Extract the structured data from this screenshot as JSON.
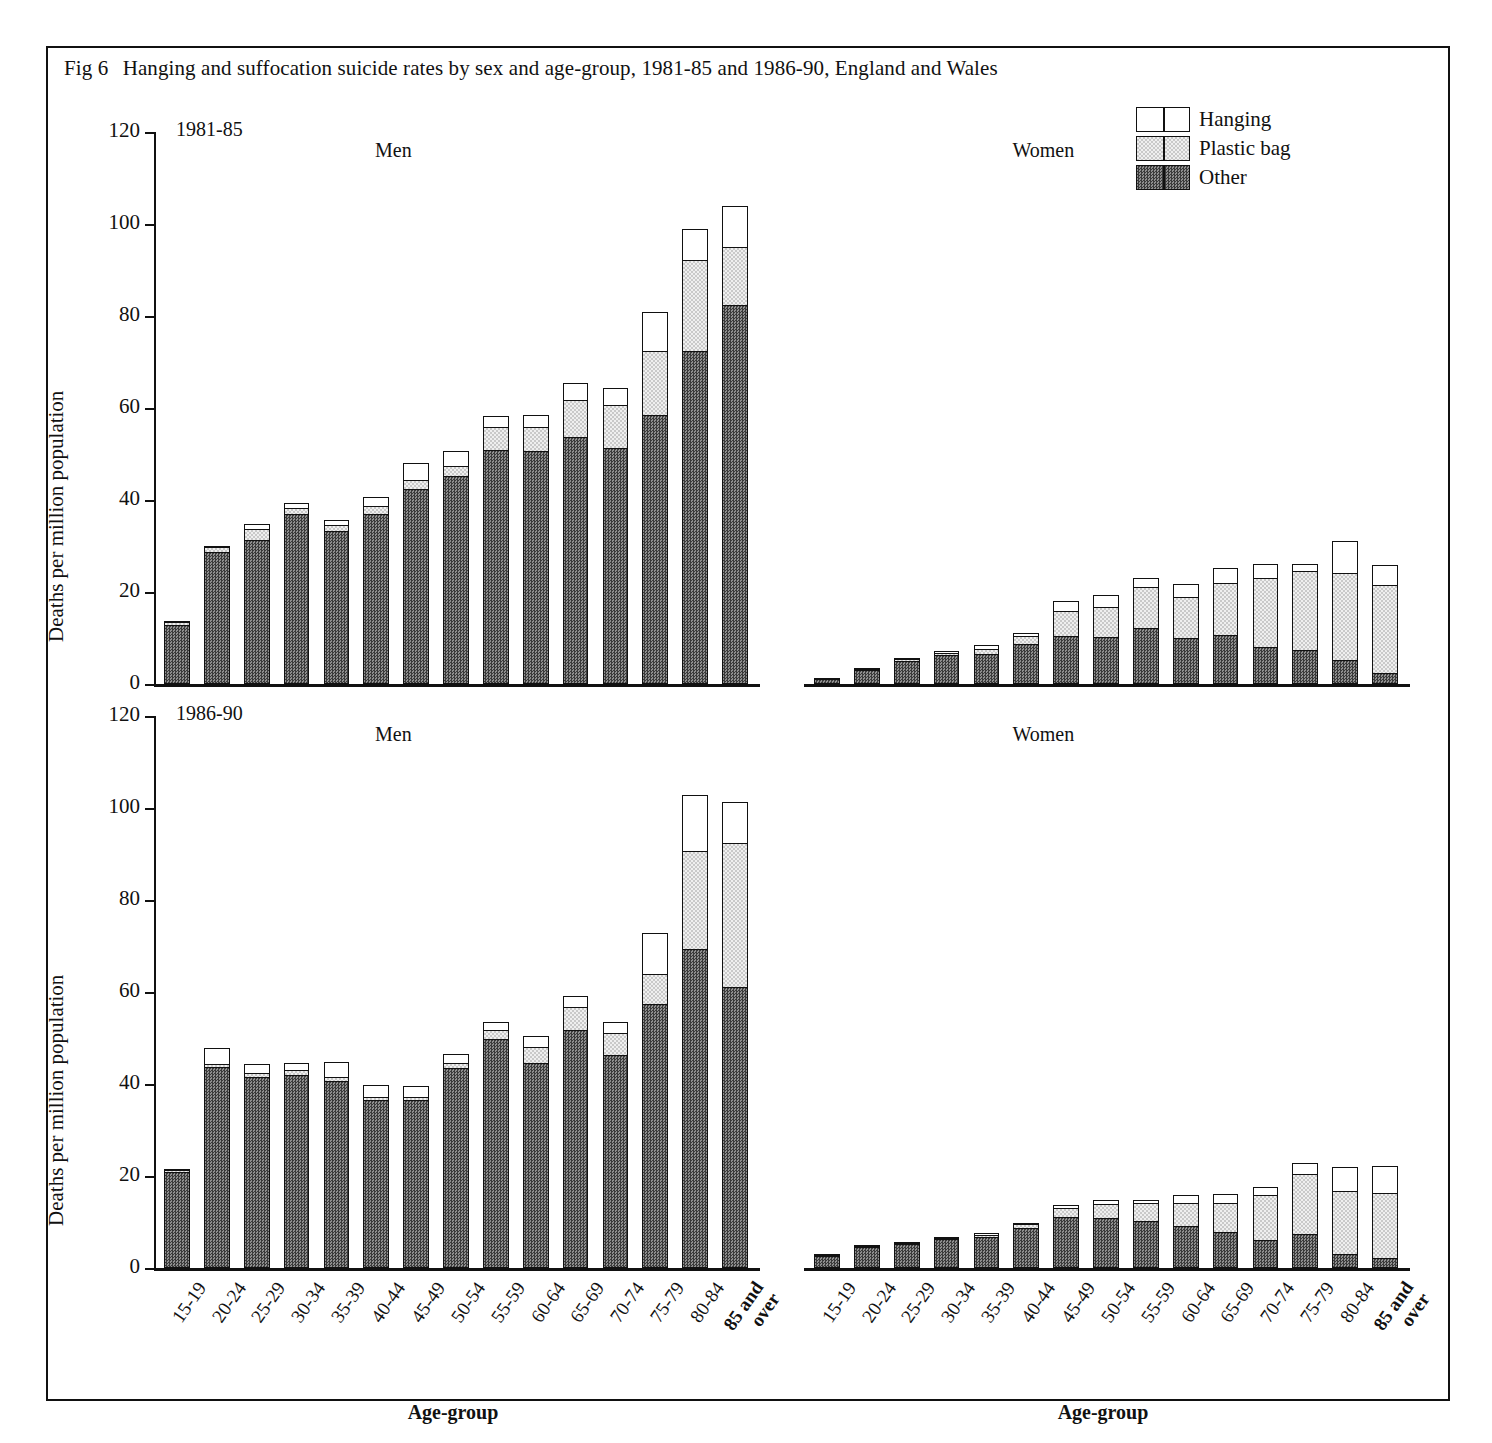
{
  "caption": {
    "fig_number": "Fig 6",
    "text": "Hanging and suffocation suicide rates by sex and age-group, 1981-85 and 1986-90,  England and Wales"
  },
  "legend": {
    "position": "top-right",
    "items": [
      {
        "label": "Hanging",
        "fill": "hanging",
        "color": "#ffffff"
      },
      {
        "label": "Plastic bag",
        "fill": "plastic",
        "color": "#e8e8e8"
      },
      {
        "label": "Other",
        "fill": "other",
        "color": "#5a5a5a"
      }
    ]
  },
  "axes": {
    "y_title": "Deaths per million population",
    "x_title": "Age-group",
    "y_ticks": [
      0,
      20,
      40,
      60,
      80,
      100,
      120
    ],
    "y_tick_labels": [
      "0",
      "20",
      "40",
      "60",
      "80",
      "100",
      "120"
    ],
    "ylim": [
      0,
      120
    ]
  },
  "panels": [
    {
      "period": "1981-85",
      "sex": "Men",
      "key": "men_1981_85"
    },
    {
      "period": "1981-85",
      "sex": "Women",
      "key": "women_1981_85"
    },
    {
      "period": "1986-90",
      "sex": "Men",
      "key": "men_1986_90"
    },
    {
      "period": "1986-90",
      "sex": "Women",
      "key": "women_1986_90"
    }
  ],
  "chart_data": {
    "type": "bar",
    "subtype": "stacked",
    "title": "Fig 6  Hanging and suffocation suicide rates by sex and age-group, 1981-85 and 1986-90,  England and Wales",
    "xlabel": "Age-group",
    "ylabel": "Deaths per million population",
    "ylim": [
      0,
      120
    ],
    "ytick_step": 20,
    "grid": false,
    "legend_position": "top-right",
    "categories": [
      "15-19",
      "20-24",
      "25-29",
      "30-34",
      "35-39",
      "40-44",
      "45-49",
      "50-54",
      "55-59",
      "60-64",
      "65-69",
      "70-74",
      "75-79",
      "80-84",
      "85 and over"
    ],
    "stack_order": [
      "Other",
      "Plastic bag",
      "Hanging"
    ],
    "panels": [
      {
        "period": "1981-85",
        "sex": "Men",
        "series": [
          {
            "name": "Other",
            "values": [
              12.8,
              28.8,
              31.3,
              37.0,
              33.3,
              37.0,
              42.4,
              45.2,
              50.9,
              50.6,
              53.6,
              51.3,
              58.5,
              72.5,
              82.3
            ]
          },
          {
            "name": "Plastic bag",
            "values": [
              0.9,
              1.2,
              2.7,
              1.5,
              1.5,
              1.9,
              2.2,
              2.4,
              5.2,
              5.5,
              8.3,
              9.6,
              14.2,
              19.9,
              13.0
            ]
          },
          {
            "name": "Hanging",
            "values": [
              0.4,
              0.6,
              1.2,
              1.4,
              1.4,
              2.2,
              4.0,
              3.6,
              2.6,
              2.8,
              4.1,
              4.0,
              8.8,
              7.0,
              9.2
            ]
          }
        ],
        "totals": [
          14.1,
          30.6,
          35.2,
          39.9,
          36.2,
          41.1,
          48.6,
          51.2,
          58.7,
          58.9,
          66.0,
          64.9,
          81.5,
          99.4,
          104.5
        ]
      },
      {
        "period": "1981-85",
        "sex": "Women",
        "series": [
          {
            "name": "Other",
            "values": [
              1.1,
              3.0,
              4.9,
              6.2,
              6.6,
              8.6,
              10.5,
              10.2,
              12.2,
              10.1,
              10.7,
              8.0,
              7.4,
              5.3,
              2.5
            ]
          },
          {
            "name": "Plastic bag",
            "values": [
              0.2,
              0.5,
              0.7,
              0.9,
              1.2,
              2.2,
              5.6,
              6.9,
              9.1,
              9.1,
              11.6,
              15.2,
              17.4,
              19.1,
              19.3
            ]
          },
          {
            "name": "Hanging",
            "values": [
              0.1,
              0.3,
              0.4,
              0.5,
              1.2,
              0.9,
              2.4,
              2.7,
              2.3,
              3.0,
              3.5,
              3.5,
              1.8,
              7.1,
              4.6
            ]
          }
        ],
        "totals": [
          1.4,
          3.8,
          6.0,
          7.6,
          9.0,
          11.7,
          18.5,
          19.8,
          23.6,
          22.2,
          25.8,
          26.7,
          26.6,
          31.5,
          26.4
        ]
      },
      {
        "period": "1986-90",
        "sex": "Men",
        "series": [
          {
            "name": "Other",
            "values": [
              20.9,
              43.7,
              41.5,
              42.0,
              40.7,
              36.6,
              36.5,
              43.4,
              49.7,
              44.6,
              51.7,
              46.4,
              57.5,
              69.4,
              61.1
            ]
          },
          {
            "name": "Plastic bag",
            "values": [
              0.7,
              1.0,
              1.2,
              1.2,
              1.0,
              0.8,
              0.9,
              1.5,
              2.4,
              3.6,
              5.2,
              5.0,
              6.7,
              21.5,
              31.6
            ]
          },
          {
            "name": "Hanging",
            "values": [
              0.2,
              3.6,
              2.1,
              1.8,
              3.5,
              2.8,
              2.6,
              2.2,
              2.0,
              2.7,
              2.8,
              2.7,
              9.1,
              12.4,
              9.1
            ]
          }
        ],
        "totals": [
          21.8,
          48.3,
          44.8,
          45.0,
          45.2,
          40.2,
          40.0,
          47.1,
          54.1,
          50.9,
          59.7,
          54.1,
          73.3,
          103.3,
          101.8
        ]
      },
      {
        "period": "1986-90",
        "sex": "Women",
        "series": [
          {
            "name": "Other",
            "values": [
              2.9,
              4.6,
              5.2,
              6.4,
              6.8,
              8.7,
              11.0,
              10.9,
              10.3,
              9.1,
              7.8,
              6.1,
              7.5,
              3.1,
              2.1
            ]
          },
          {
            "name": "Plastic bag",
            "values": [
              0.1,
              0.3,
              0.4,
              0.4,
              0.7,
              1.2,
              2.2,
              3.3,
              4.1,
              5.2,
              6.7,
              10.1,
              13.1,
              13.9,
              14.5
            ]
          },
          {
            "name": "Hanging",
            "values": [
              0.1,
              0.2,
              0.2,
              0.4,
              0.6,
              0.4,
              1.0,
              1.1,
              0.8,
              2.0,
              2.1,
              1.9,
              2.7,
              5.5,
              6.2
            ]
          }
        ],
        "totals": [
          3.1,
          5.1,
          5.8,
          7.2,
          8.1,
          10.3,
          14.2,
          15.3,
          15.2,
          16.3,
          16.6,
          18.1,
          23.3,
          22.5,
          22.8
        ]
      }
    ]
  }
}
